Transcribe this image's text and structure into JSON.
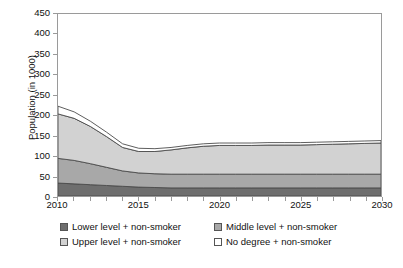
{
  "chart_data": {
    "type": "area",
    "stacked": true,
    "title": "",
    "subtitle": "",
    "xlabel": "",
    "ylabel": "Population (in 1000)",
    "xlim": [
      2010,
      2030
    ],
    "ylim": [
      0,
      450
    ],
    "ytick_step": 50,
    "xtick_step": 1,
    "xtick_label_step": 5,
    "grid": false,
    "legend_position": "bottom",
    "x": [
      2010,
      2011,
      2012,
      2013,
      2014,
      2015,
      2016,
      2017,
      2018,
      2019,
      2020,
      2021,
      2022,
      2023,
      2024,
      2025,
      2026,
      2027,
      2028,
      2029,
      2030
    ],
    "ytick_labels": [
      "0",
      "50",
      "100",
      "150",
      "200",
      "250",
      "300",
      "350",
      "400",
      "450"
    ],
    "xtick_labels": [
      "2010",
      "2015",
      "2020",
      "2025",
      "2030"
    ],
    "series": [
      {
        "name": "Lower level + non-smoker",
        "color": "#6e6e6e",
        "values": [
          32,
          30,
          28,
          26,
          24,
          22,
          21,
          20,
          20,
          20,
          20,
          20,
          20,
          20,
          20,
          20,
          20,
          20,
          20,
          20,
          20
        ]
      },
      {
        "name": "Middle level + non-smoker",
        "color": "#a8a8a8",
        "values": [
          61,
          58,
          52,
          45,
          38,
          35,
          34,
          34,
          34,
          34,
          34,
          34,
          34,
          34,
          34,
          34,
          34,
          34,
          34,
          34,
          34
        ]
      },
      {
        "name": "Upper level + non-smoker",
        "color": "#d2d2d2",
        "values": [
          110,
          104,
          92,
          76,
          58,
          53,
          55,
          60,
          65,
          69,
          71,
          71,
          71,
          72,
          72,
          72,
          73,
          74,
          75,
          76,
          77
        ]
      },
      {
        "name": "No degree + non-smoker",
        "color": "#ffffff",
        "values": [
          19,
          16,
          13,
          11,
          9,
          8,
          7,
          6,
          6,
          6,
          6,
          6,
          6,
          6,
          6,
          6,
          6,
          6,
          6,
          6,
          6
        ]
      }
    ],
    "totals": [
      222,
      208,
      185,
      158,
      129,
      118,
      117,
      120,
      125,
      129,
      131,
      131,
      131,
      132,
      132,
      132,
      133,
      134,
      135,
      136,
      137
    ]
  },
  "axes": {
    "y_title": "Population (in 1000)"
  },
  "legend": {
    "items": [
      {
        "label": "Lower level + non-smoker",
        "color": "#6e6e6e"
      },
      {
        "label": "Middle level + non-smoker",
        "color": "#a8a8a8"
      },
      {
        "label": "Upper level + non-smoker",
        "color": "#d2d2d2"
      },
      {
        "label": "No degree + non-smoker",
        "color": "#ffffff"
      }
    ]
  }
}
